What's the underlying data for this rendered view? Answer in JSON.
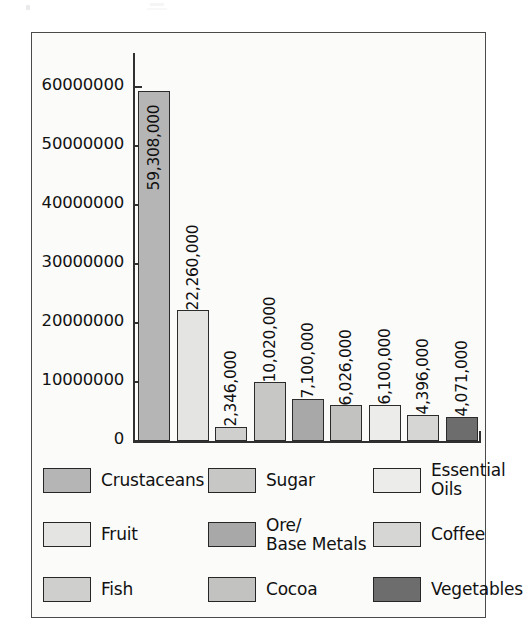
{
  "figure": {
    "frame_visible": true,
    "background": "#fbfbfa"
  },
  "chart_data": {
    "type": "bar",
    "title": "",
    "xlabel": "",
    "ylabel": "",
    "ylim": [
      0,
      62000000
    ],
    "grid": false,
    "legend_position": "bottom",
    "categories": [
      "Crustaceans",
      "Fruit",
      "Fish",
      "Sugar",
      "Ore/\nBase Metals",
      "Cocoa",
      "Essential\nOils",
      "Coffee",
      "Vegetables"
    ],
    "values": [
      59308000,
      22260000,
      2346000,
      10020000,
      7100000,
      6026000,
      6100000,
      4396000,
      4071000
    ],
    "value_labels": [
      "59,308,000",
      "22,260,000",
      "2,346,000",
      "10,020,000",
      "7,100,000",
      "6,026,000",
      "6,100,000",
      "4,396,000",
      "4,071,000"
    ],
    "bar_colors": [
      "#b5b5b5",
      "#e4e4e2",
      "#cfcfcd",
      "#c7c7c5",
      "#a8a8a8",
      "#c2c2c0",
      "#ececea",
      "#d6d6d4",
      "#6d6d6d"
    ],
    "yticks": [
      0,
      10000000,
      20000000,
      30000000,
      40000000,
      50000000,
      60000000
    ],
    "ytick_labels": [
      "0",
      "10000000",
      "20000000",
      "30000000",
      "40000000",
      "50000000",
      "60000000"
    ]
  },
  "legend": {
    "items": [
      {
        "label": "Crustaceans",
        "color": "#b5b5b5"
      },
      {
        "label": "Sugar",
        "color": "#c7c7c5"
      },
      {
        "label": "Essential\nOils",
        "color": "#ececea"
      },
      {
        "label": "Fruit",
        "color": "#e4e4e2"
      },
      {
        "label": "Ore/\nBase Metals",
        "color": "#a8a8a8"
      },
      {
        "label": "Coffee",
        "color": "#d6d6d4"
      },
      {
        "label": "Fish",
        "color": "#cfcfcd"
      },
      {
        "label": "Cocoa",
        "color": "#c2c2c0"
      },
      {
        "label": "Vegetables",
        "color": "#6d6d6d"
      }
    ]
  }
}
